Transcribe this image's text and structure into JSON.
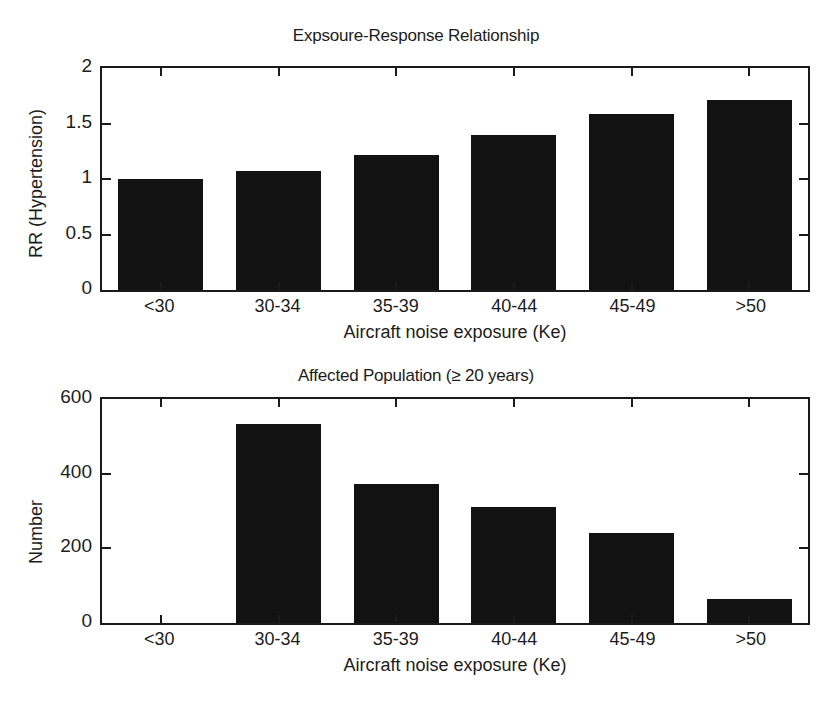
{
  "chart_data": [
    {
      "type": "bar",
      "id": "exposure-response",
      "title": "Expsoure-Response Relationship",
      "xlabel": "Aircraft noise exposure (Ke)",
      "ylabel": "RR (Hypertension)",
      "categories": [
        "<30",
        "30-34",
        "35-39",
        "40-44",
        "45-49",
        ">50"
      ],
      "values": [
        1.0,
        1.07,
        1.22,
        1.4,
        1.59,
        1.71
      ],
      "ylim": [
        0,
        2
      ],
      "yticks": [
        0,
        0.5,
        1,
        1.5,
        2
      ],
      "ytick_labels": [
        "0",
        "0.5",
        "1",
        "1.5",
        "2"
      ],
      "grid": false,
      "legend": "none",
      "bar_color": "#121212"
    },
    {
      "type": "bar",
      "id": "affected-population",
      "title": "Affected Population (≥ 20 years)",
      "xlabel": "Aircraft noise exposure (Ke)",
      "ylabel": "Number",
      "categories": [
        "<30",
        "30-34",
        "35-39",
        "40-44",
        "45-49",
        ">50"
      ],
      "values": [
        0,
        533,
        372,
        310,
        242,
        63
      ],
      "ylim": [
        0,
        600
      ],
      "yticks": [
        0,
        200,
        400,
        600
      ],
      "ytick_labels": [
        "0",
        "200",
        "400",
        "600"
      ],
      "grid": false,
      "legend": "none",
      "bar_color": "#121212"
    }
  ]
}
